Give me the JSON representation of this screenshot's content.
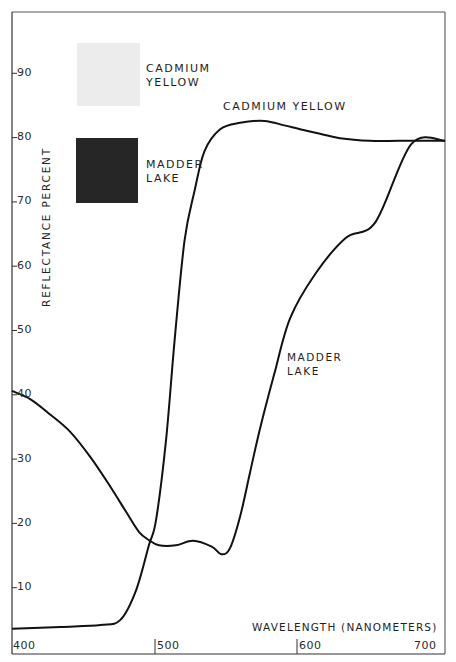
{
  "chart_data": {
    "type": "line",
    "title": "",
    "xlabel": "WAVELENGTH (NANOMETERS)",
    "ylabel": "REFLECTANCE PERCENT",
    "xlim": [
      400,
      700
    ],
    "ylim": [
      0,
      100
    ],
    "x_ticks": [
      400,
      500,
      600,
      700
    ],
    "y_ticks": [
      10,
      20,
      30,
      40,
      50,
      60,
      70,
      80,
      90
    ],
    "grid": false,
    "legend": {
      "position": "upper-left",
      "entries": [
        {
          "name": "CADMIUM YELLOW",
          "line1": "CADMIUM",
          "line2": "YELLOW",
          "swatch_color": "#ececec"
        },
        {
          "name": "MADDER LAKE",
          "line1": "MADDER",
          "line2": "LAKE",
          "swatch_color": "#262626"
        }
      ]
    },
    "annotations": [
      {
        "text": "CADMIUM YELLOW",
        "x": 590,
        "y": 86
      },
      {
        "text": "MADDER",
        "x": 604,
        "y": 49
      },
      {
        "text": "LAKE",
        "x": 604,
        "y": 46.5
      }
    ],
    "series": [
      {
        "name": "CADMIUM YELLOW",
        "x": [
          400,
          434,
          462,
          476,
          487,
          496,
          501,
          508,
          514,
          521,
          528,
          535,
          546,
          560,
          577,
          591,
          602,
          616,
          630,
          651,
          672,
          704
        ],
        "y": [
          3.6,
          3.9,
          4.2,
          5.0,
          9.6,
          16.6,
          20.5,
          32.9,
          48.4,
          64.0,
          71.7,
          77.9,
          81.3,
          82.3,
          82.6,
          81.9,
          81.3,
          80.6,
          79.9,
          79.5,
          79.5,
          79.5
        ]
      },
      {
        "name": "MADDER LAKE",
        "x": [
          400,
          413,
          427,
          441,
          455,
          469,
          480,
          489,
          496,
          503,
          515,
          527,
          540,
          547,
          553,
          560,
          567,
          574,
          584,
          595,
          613,
          634,
          655,
          680,
          704
        ],
        "y": [
          40.6,
          39.3,
          36.9,
          34.2,
          30.3,
          25.7,
          21.8,
          18.7,
          17.4,
          16.6,
          16.6,
          17.3,
          16.4,
          15.2,
          16.2,
          21.1,
          28.0,
          34.8,
          43.3,
          51.9,
          58.9,
          64.4,
          66.9,
          79.0,
          79.5
        ]
      }
    ]
  },
  "axis": {
    "y_ticks": [
      {
        "label": "90",
        "y": 74
      },
      {
        "label": "80",
        "y": 138
      },
      {
        "label": "70",
        "y": 202
      },
      {
        "label": "60",
        "y": 267
      },
      {
        "label": "50",
        "y": 331
      },
      {
        "label": "40",
        "y": 395
      },
      {
        "label": "30",
        "y": 460
      },
      {
        "label": "20",
        "y": 524
      },
      {
        "label": "10",
        "y": 588
      }
    ],
    "x_ticks": [
      {
        "label": "400"
      },
      {
        "label": "500"
      },
      {
        "label": "600"
      },
      {
        "label": "700"
      }
    ]
  },
  "colors": {
    "line": "#111111",
    "frame": "#444444",
    "cadmium_swatch": "#ececec",
    "madder_swatch": "#262626"
  }
}
